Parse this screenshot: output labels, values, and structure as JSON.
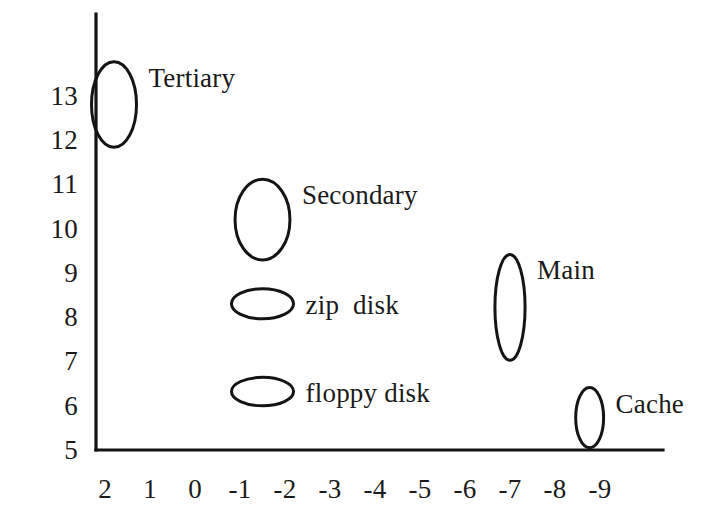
{
  "chart_data": {
    "type": "scatter",
    "title": "",
    "subtitle": "",
    "xlabel": "",
    "ylabel": "",
    "xlim": [
      2.5,
      -9.7
    ],
    "ylim": [
      5,
      13.4
    ],
    "grid": false,
    "legend": "none",
    "x_ticks": [
      "2",
      "1",
      "0",
      "-1",
      "-2",
      "-3",
      "-4",
      "-5",
      "-6",
      "-7",
      "-8",
      "-9"
    ],
    "x_tick_values": [
      2,
      1,
      0,
      -1,
      -2,
      -3,
      -4,
      -5,
      -6,
      -7,
      -8,
      -9
    ],
    "y_ticks": [
      "13",
      "12",
      "11",
      "10",
      "9",
      "8",
      "7",
      "6",
      "5"
    ],
    "y_tick_values": [
      13,
      12,
      11,
      10,
      9,
      8,
      7,
      6,
      5
    ],
    "marker_shape": "ellipse",
    "points": [
      {
        "label": "Tertiary",
        "x": 1.8,
        "y": 12.8,
        "width_units": 1.0,
        "height_units": 1.93,
        "label_side": "right"
      },
      {
        "label": "Secondary",
        "x": -1.5,
        "y": 10.2,
        "width_units": 1.22,
        "height_units": 1.82,
        "label_side": "right"
      },
      {
        "label": "zip  disk",
        "x": -1.5,
        "y": 8.3,
        "width_units": 1.38,
        "height_units": 0.68,
        "label_side": "right"
      },
      {
        "label": "floppy disk",
        "x": -1.5,
        "y": 6.32,
        "width_units": 1.38,
        "height_units": 0.64,
        "label_side": "right"
      },
      {
        "label": "Main",
        "x": -7.0,
        "y": 8.22,
        "width_units": 0.67,
        "height_units": 2.39,
        "label_side": "right"
      },
      {
        "label": "Cache",
        "x": -8.77,
        "y": 5.73,
        "width_units": 0.62,
        "height_units": 1.36,
        "label_side": "right"
      }
    ]
  },
  "colors": {
    "background": "#ffffff",
    "axis": "#141414",
    "marker_stroke": "#141414",
    "text": "#1a1a1a"
  },
  "geometry": {
    "axis_x_px": 96,
    "axis_y_px": 450,
    "axis_top_px": 14,
    "axis_right_px": 663,
    "x_origin_px": 105,
    "x_unit_px": 45.0,
    "y_origin_px": 450,
    "y_unit_px": 44.3
  }
}
